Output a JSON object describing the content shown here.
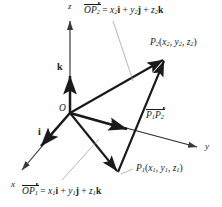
{
  "figure": {
    "background_color": "#fefefe",
    "line_color": "#1a1a1a",
    "thin_line_color": "#9a9a9a"
  },
  "axes": [
    {
      "name": "x-axis",
      "label": "x",
      "x": 11,
      "y": 180
    },
    {
      "name": "y-axis",
      "label": "y",
      "x": 205,
      "y": 142
    },
    {
      "name": "z-axis",
      "label": "z",
      "x": 68,
      "y": 2
    }
  ],
  "origin": {
    "label": "O",
    "x": 59,
    "y": 104
  },
  "unit_vectors": [
    {
      "name": "i",
      "label": "i",
      "x": 38,
      "y": 127
    },
    {
      "name": "j",
      "label": "j",
      "x": 110,
      "y": 120
    },
    {
      "name": "k",
      "label": "k",
      "x": 57,
      "y": 62
    }
  ],
  "points": [
    {
      "name": "P2",
      "label_parts": {
        "p": "P",
        "sub": "2",
        "coords_open": "(",
        "x": "x",
        "xsub": "2",
        "sep1": ", ",
        "y": "y",
        "ysub": "2",
        "sep2": ", ",
        "z": "z",
        "zsub": "2",
        "coords_close": ")"
      },
      "x": 150,
      "y": 38
    },
    {
      "name": "P1",
      "label_parts": {
        "p": "P",
        "sub": "1",
        "coords_open": "(",
        "x": "x",
        "xsub": "1",
        "sep1": ", ",
        "y": "y",
        "ysub": "1",
        "sep2": ", ",
        "z": "z",
        "zsub": "1",
        "coords_close": ")"
      },
      "x": 136,
      "y": 164
    }
  ],
  "vectors": [
    {
      "name": "P1P2",
      "notation": {
        "p1": "P",
        "p1sub": "1",
        "p2": "P",
        "p2sub": "2"
      },
      "x": 146,
      "y": 110
    }
  ],
  "equations": [
    {
      "name": "OP2-equation",
      "vector": {
        "o": "O",
        "p": "P",
        "sub": "2"
      },
      "eq": " = ",
      "terms": [
        {
          "coef": "x",
          "sub": "2",
          "basis": "i"
        },
        {
          "coef": "y",
          "sub": "2",
          "basis": "j"
        },
        {
          "coef": "z",
          "sub": "2",
          "basis": "k"
        }
      ],
      "plus": " + ",
      "x": 84,
      "y": 5
    },
    {
      "name": "OP1-equation",
      "vector": {
        "o": "O",
        "p": "P",
        "sub": "1"
      },
      "eq": " = ",
      "terms": [
        {
          "coef": "x",
          "sub": "1",
          "basis": "i"
        },
        {
          "coef": "y",
          "sub": "1",
          "basis": "j"
        },
        {
          "coef": "z",
          "sub": "1",
          "basis": "k"
        }
      ],
      "plus": " + ",
      "x": 22,
      "y": 186
    }
  ]
}
